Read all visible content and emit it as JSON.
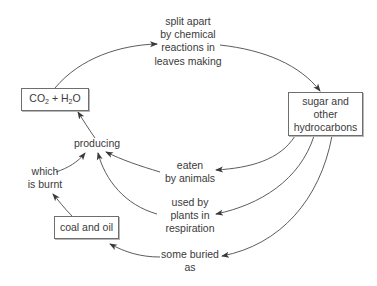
{
  "diagram": {
    "type": "carbon-cycle flow diagram",
    "nodes": {
      "co2_h2o": {
        "parts": [
          "CO",
          "2",
          " + H",
          "2",
          "O"
        ],
        "text": "CO2 + H2O"
      },
      "sugar": {
        "lines": [
          "sugar and",
          "other",
          "hydrocarbons"
        ]
      },
      "coal_oil": {
        "text": "coal and oil"
      }
    },
    "edge_labels": {
      "split": {
        "lines": [
          "split apart",
          "by chemical",
          "reactions in",
          "leaves making"
        ]
      },
      "producing": {
        "text": "producing"
      },
      "burnt": {
        "lines": [
          "which",
          "is burnt"
        ]
      },
      "eaten": {
        "lines": [
          "eaten",
          "by animals"
        ]
      },
      "respiration": {
        "lines": [
          "used by",
          "plants in",
          "respiration"
        ]
      },
      "buried": {
        "lines": [
          "some buried",
          "as"
        ]
      }
    },
    "colors": {
      "line": "#4a4a4a",
      "text": "#3a3a3a",
      "box_border": "#6e6e6e"
    }
  }
}
